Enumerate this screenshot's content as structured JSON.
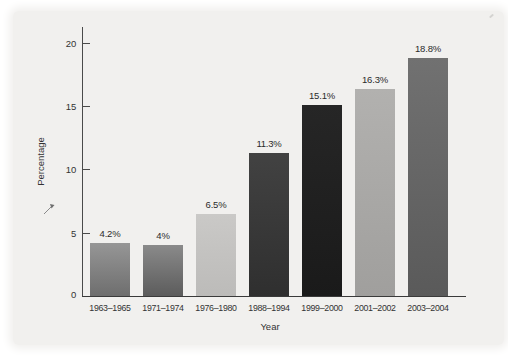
{
  "figure": {
    "background_color": "#f1f0ee",
    "axis_color": "#3a3a3a",
    "text_color": "#333333"
  },
  "chart_data": {
    "type": "bar",
    "title": "",
    "xlabel": "Year",
    "ylabel": "Percentage",
    "categories": [
      "1963–1965",
      "1971–1974",
      "1976–1980",
      "1988–1994",
      "1999–2000",
      "2001–2002",
      "2003–2004"
    ],
    "values": [
      4.2,
      4,
      6.5,
      11.3,
      15.1,
      16.3,
      18.8
    ],
    "bar_labels": [
      "4.2%",
      "4%",
      "6.5%",
      "11.3%",
      "15.1%",
      "16.3%",
      "18.8%"
    ],
    "ylim": [
      0,
      20
    ],
    "yticks": [
      0,
      5,
      10,
      15,
      20
    ],
    "grid": false,
    "legend": null,
    "bar_colors": [
      [
        "#969696",
        "#6e6e6e"
      ],
      [
        "#8a8a8a",
        "#5c5c5c"
      ],
      [
        "#cac9c7",
        "#bcbbb9"
      ],
      [
        "#424242",
        "#2f2f2f"
      ],
      [
        "#262626",
        "#1a1a1a"
      ],
      [
        "#b2b1af",
        "#a09f9d"
      ],
      [
        "#717171",
        "#5a5a5a"
      ]
    ]
  }
}
